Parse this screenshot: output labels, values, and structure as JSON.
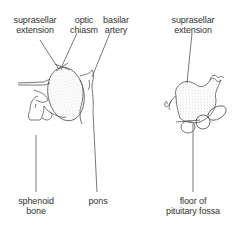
{
  "diagram": {
    "left_panel": {
      "labels": {
        "suprasellar_extension": [
          "suprasellar",
          "extension"
        ],
        "optic_chiasm": [
          "optic",
          "chiasm"
        ],
        "basilar_artery": [
          "basilar",
          "artery"
        ],
        "sphenoid_bone": [
          "sphenoid",
          "bone"
        ],
        "pons": [
          "pons"
        ]
      }
    },
    "right_panel": {
      "labels": {
        "suprasellar_extension": [
          "suprasellar",
          "extension"
        ],
        "floor_of_pituitary_fossa": [
          "floor of",
          "pituitary fossa"
        ]
      }
    },
    "colors": {
      "line": "#555555",
      "text": "#333333",
      "stipple": "#bbbbbb"
    }
  }
}
